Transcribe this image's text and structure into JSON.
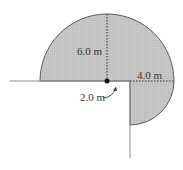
{
  "diagram": {
    "labels": {
      "radius_large": "6.0 m",
      "radius_small": "4.0 m",
      "offset": "2.0 m"
    },
    "colors": {
      "fill": "#c4c4c4",
      "outline": "#5a5a5a",
      "wall": "#8a8a8a",
      "dot": "#111111"
    }
  }
}
